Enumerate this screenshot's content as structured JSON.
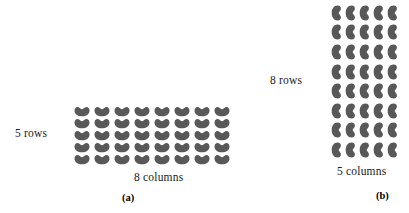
{
  "figure": {
    "background_color": "#ffffff",
    "bean_color": "#585858"
  },
  "panels": [
    {
      "id": "a",
      "caption": "(a)",
      "rows": 5,
      "columns": 8,
      "total_beans": 40,
      "row_label": "5 rows",
      "column_label": "8 columns",
      "bean_orientation": "horizontal"
    },
    {
      "id": "b",
      "caption": "(b)",
      "rows": 8,
      "columns": 5,
      "total_beans": 40,
      "row_label": "8 rows",
      "column_label": "5 columns",
      "bean_orientation": "vertical"
    }
  ],
  "chart_data": {
    "type": "table",
    "title": "",
    "xlabel": "",
    "ylabel": "",
    "categories": [
      "(a)",
      "(b)"
    ],
    "series": [
      {
        "name": "rows",
        "values": [
          5,
          8
        ]
      },
      {
        "name": "columns",
        "values": [
          8,
          5
        ]
      },
      {
        "name": "total beans",
        "values": [
          40,
          40
        ]
      }
    ]
  }
}
